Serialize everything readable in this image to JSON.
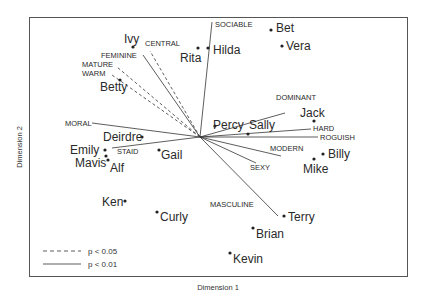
{
  "chart_data": {
    "type": "scatter",
    "subtype": "biplot",
    "title": "",
    "xlabel": "Dimension 1",
    "ylabel": "Dimension 2",
    "grid": false,
    "legend_position": "bottom-left",
    "legend": [
      {
        "style": "dashed",
        "label": "p < 0.05"
      },
      {
        "style": "solid",
        "label": "p < 0.01"
      }
    ],
    "origin": {
      "x": 200,
      "y": 137
    },
    "points": [
      {
        "name": "Ivy",
        "x": 133,
        "y": 47,
        "lx": 124,
        "ly": 43,
        "anchor": "start"
      },
      {
        "name": "Rita",
        "x": 198,
        "y": 48,
        "lx": 180,
        "ly": 62,
        "anchor": "start"
      },
      {
        "name": "Hilda",
        "x": 208,
        "y": 48,
        "lx": 213,
        "ly": 54,
        "anchor": "start"
      },
      {
        "name": "Bet",
        "x": 271,
        "y": 30,
        "lx": 276,
        "ly": 32,
        "anchor": "start"
      },
      {
        "name": "Vera",
        "x": 282,
        "y": 46,
        "lx": 286,
        "ly": 50,
        "anchor": "start"
      },
      {
        "name": "Betty",
        "x": 120,
        "y": 80,
        "lx": 100,
        "ly": 91,
        "anchor": "start"
      },
      {
        "name": "Percy",
        "x": 215,
        "y": 126,
        "lx": 213,
        "ly": 129,
        "anchor": "start"
      },
      {
        "name": "Sally",
        "x": 248,
        "y": 134,
        "lx": 249,
        "ly": 129,
        "anchor": "start"
      },
      {
        "name": "Jack",
        "x": 314,
        "y": 121,
        "lx": 300,
        "ly": 117,
        "anchor": "start"
      },
      {
        "name": "Deirdre",
        "x": 142,
        "y": 137,
        "lx": 103,
        "ly": 141,
        "anchor": "start"
      },
      {
        "name": "Emily",
        "x": 105,
        "y": 150,
        "lx": 70,
        "ly": 154,
        "anchor": "start"
      },
      {
        "name": "Mavis",
        "x": 106,
        "y": 156,
        "lx": 75,
        "ly": 167,
        "anchor": "start"
      },
      {
        "name": "Alf",
        "x": 108,
        "y": 160,
        "lx": 110,
        "ly": 172,
        "anchor": "start"
      },
      {
        "name": "Gail",
        "x": 159,
        "y": 150,
        "lx": 161,
        "ly": 159,
        "anchor": "start"
      },
      {
        "name": "Billy",
        "x": 323,
        "y": 154,
        "lx": 328,
        "ly": 158,
        "anchor": "start"
      },
      {
        "name": "Mike",
        "x": 314,
        "y": 159,
        "lx": 303,
        "ly": 173,
        "anchor": "start"
      },
      {
        "name": "Ken",
        "x": 125,
        "y": 201,
        "lx": 102,
        "ly": 206,
        "anchor": "start"
      },
      {
        "name": "Curly",
        "x": 157,
        "y": 212,
        "lx": 160,
        "ly": 221,
        "anchor": "start"
      },
      {
        "name": "Terry",
        "x": 284,
        "y": 216,
        "lx": 288,
        "ly": 221,
        "anchor": "start"
      },
      {
        "name": "Brian",
        "x": 253,
        "y": 228,
        "lx": 256,
        "ly": 238,
        "anchor": "start"
      },
      {
        "name": "Kevin",
        "x": 230,
        "y": 253,
        "lx": 233,
        "ly": 263,
        "anchor": "start"
      }
    ],
    "vectors": [
      {
        "name": "SOCIABLE",
        "x2": 212,
        "y2": 22,
        "style": "solid",
        "lx": 215,
        "ly": 27,
        "anchor": "start"
      },
      {
        "name": "CENTRAL",
        "x2": 150,
        "y2": 51,
        "style": "dashed",
        "lx": 145,
        "ly": 46,
        "anchor": "start"
      },
      {
        "name": "FEMININE",
        "x2": 143,
        "y2": 55,
        "style": "solid",
        "lx": 101,
        "ly": 58,
        "anchor": "start"
      },
      {
        "name": "MATURE",
        "x2": 117,
        "y2": 67,
        "style": "dashed",
        "lx": 82,
        "ly": 67,
        "anchor": "start"
      },
      {
        "name": "WARM",
        "x2": 112,
        "y2": 75,
        "style": "dashed",
        "lx": 82,
        "ly": 76,
        "anchor": "start"
      },
      {
        "name": "MORAL",
        "x2": 92,
        "y2": 123,
        "style": "solid",
        "lx": 65,
        "ly": 126,
        "anchor": "start"
      },
      {
        "name": "STAID",
        "x2": 112,
        "y2": 148,
        "style": "solid",
        "lx": 117,
        "ly": 154,
        "anchor": "start"
      },
      {
        "name": "DOMINANT",
        "x2": 285,
        "y2": 113,
        "style": "solid",
        "lx": 276,
        "ly": 100,
        "anchor": "start"
      },
      {
        "name": "HARD",
        "x2": 311,
        "y2": 129,
        "style": "solid",
        "lx": 313,
        "ly": 131,
        "anchor": "start"
      },
      {
        "name": "ROGUISH",
        "x2": 318,
        "y2": 137,
        "style": "solid",
        "lx": 320,
        "ly": 140,
        "anchor": "start"
      },
      {
        "name": "MODERN",
        "x2": 281,
        "y2": 156,
        "style": "solid",
        "lx": 270,
        "ly": 151,
        "anchor": "start"
      },
      {
        "name": "SEXY",
        "x2": 256,
        "y2": 163,
        "style": "solid",
        "lx": 250,
        "ly": 170,
        "anchor": "start"
      },
      {
        "name": "MASCULINE",
        "x2": 278,
        "y2": 216,
        "style": "solid",
        "lx": 210,
        "ly": 207,
        "anchor": "start"
      }
    ]
  },
  "axes": {
    "x_label": "Dimension 1",
    "y_label": "Dimension 2"
  },
  "legend": {
    "dashed_label": "p < 0.05",
    "solid_label": "p < 0.01"
  },
  "colors": {
    "ink": "#2a2a2a",
    "frame": "#555555",
    "background": "#ffffff"
  }
}
